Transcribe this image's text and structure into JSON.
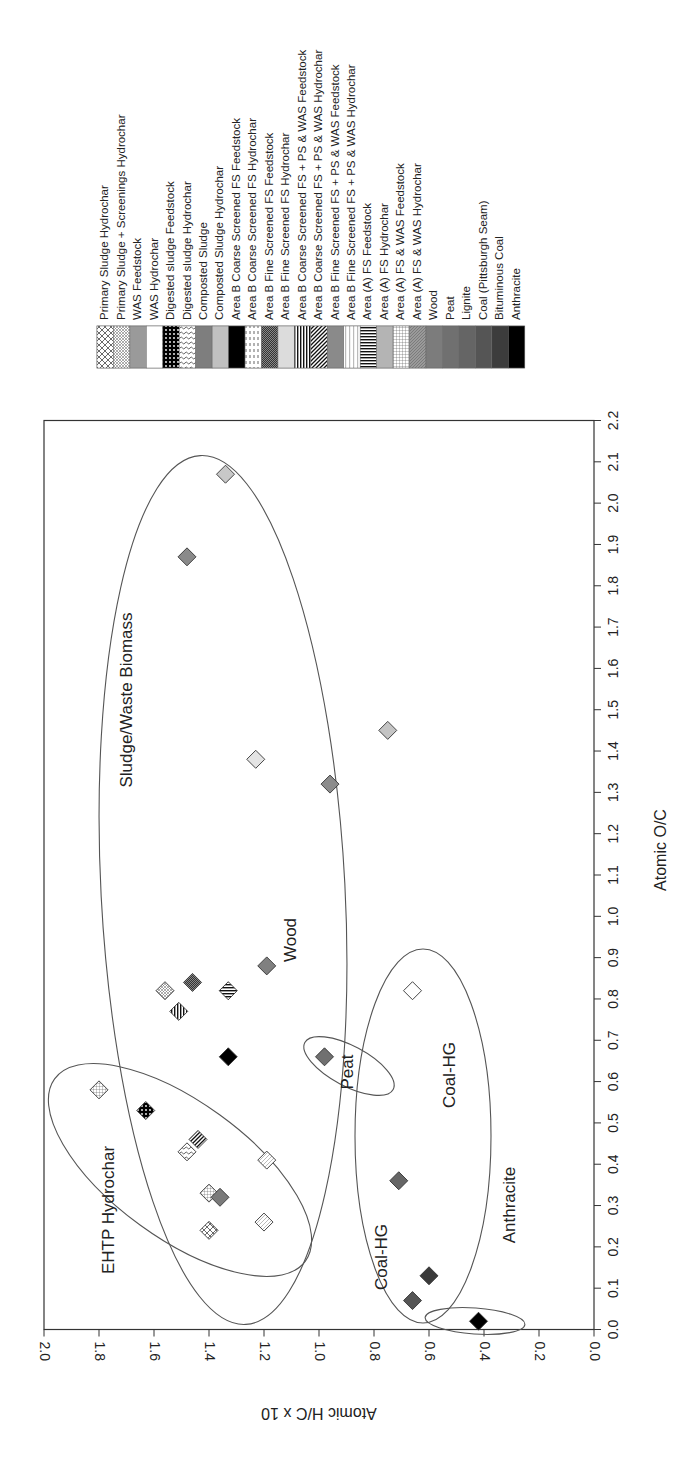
{
  "chart_data": {
    "type": "scatter",
    "title": "",
    "orientation_note": "Figure rotated 90 degrees counter-clockwise on page",
    "xlabel": "Atomic H/C x 10",
    "ylabel": "Atomic O/C",
    "xlim": [
      0.0,
      2.0
    ],
    "ylim": [
      0.0,
      2.2
    ],
    "x_ticks": [
      "0.0",
      "0.2",
      "0.4",
      "0.6",
      "0.8",
      "1.0",
      "1.2",
      "1.4",
      "1.6",
      "1.8",
      "2.0"
    ],
    "y_ticks": [
      "0.0",
      "0.1",
      "0.2",
      "0.3",
      "0.4",
      "0.5",
      "0.6",
      "0.7",
      "0.8",
      "0.9",
      "1.0",
      "1.1",
      "1.2",
      "1.3",
      "1.4",
      "1.5",
      "1.6",
      "1.7",
      "1.8",
      "1.9",
      "2.0",
      "2.1",
      "2.2"
    ],
    "grid": false,
    "legend_position": "top (rotated)",
    "legend": [
      {
        "label": "Primary Sludge Hydrochar",
        "pattern": "crosshatch-large"
      },
      {
        "label": "Primary Sludge + Screenings Hydrochar",
        "pattern": "crosshatch-fine"
      },
      {
        "label": "WAS Feedstock",
        "pattern": "gray"
      },
      {
        "label": "WAS Hydrochar",
        "pattern": "white"
      },
      {
        "label": "Digested sludge Feedstock",
        "pattern": "black-dots"
      },
      {
        "label": "Digested sludge Hydrochar",
        "pattern": "squiggle"
      },
      {
        "label": "Composted Sludge",
        "pattern": "mid-gray"
      },
      {
        "label": "Composted Sludge Hydrochar",
        "pattern": "light-gray"
      },
      {
        "label": "Area B Coarse Screened FS Feedstock",
        "pattern": "black"
      },
      {
        "label": "Area B Coarse Screened FS Hydrochar",
        "pattern": "dashes"
      },
      {
        "label": "Area B Fine Screened FS Feedstock",
        "pattern": "dark-checker"
      },
      {
        "label": "Area B Fine Screened FS Hydrochar",
        "pattern": "very-light-gray"
      },
      {
        "label": "Area B Coarse Screened FS + PS & WAS Feedstock",
        "pattern": "vertical-stripes"
      },
      {
        "label": "Area B Coarse Screened FS + PS & WAS Hydrochar",
        "pattern": "diagonal-stripes"
      },
      {
        "label": "Area B Fine Screened FS + PS & WAS Feedstock",
        "pattern": "gray-2"
      },
      {
        "label": "Area B Fine Screened FS + PS & WAS Hydrochar",
        "pattern": "thin-lines"
      },
      {
        "label": "Area (A) FS Feedstock",
        "pattern": "horizontal-stripes"
      },
      {
        "label": "Area (A) FS Hydrochar",
        "pattern": "light-gray-2"
      },
      {
        "label": "Area (A) FS & WAS Feedstock",
        "pattern": "grid"
      },
      {
        "label": "Area (A) FS & WAS Hydrochar",
        "pattern": "diag-gray"
      },
      {
        "label": "Wood",
        "pattern": "gray-3"
      },
      {
        "label": "Peat",
        "pattern": "gray-4"
      },
      {
        "label": "Lignite",
        "pattern": "gray-5"
      },
      {
        "label": "Coal (Pittsburgh Seam)",
        "pattern": "dark-gray"
      },
      {
        "label": "Bituminous Coal",
        "pattern": "darker-gray"
      },
      {
        "label": "Anthracite",
        "pattern": "black-2"
      }
    ],
    "points": [
      {
        "series": "Composted Sludge Hydrochar",
        "x": 1.34,
        "y": 2.07,
        "fill": "#c8c8c8"
      },
      {
        "series": "Composted Sludge",
        "x": 1.48,
        "y": 1.87,
        "fill": "#8a8a8a"
      },
      {
        "series": "Area (A) FS Hydrochar",
        "x": 0.75,
        "y": 1.45,
        "fill": "#c4c4c4"
      },
      {
        "series": "Area B Fine Screened FS Hydrochar",
        "x": 1.23,
        "y": 1.38,
        "fill": "#e4e4e4"
      },
      {
        "series": "WAS Feedstock",
        "x": 0.96,
        "y": 1.32,
        "fill": "#8c8c8c"
      },
      {
        "series": "Wood",
        "x": 1.19,
        "y": 0.88,
        "fill": "#808080"
      },
      {
        "series": "Area B Fine Screened FS Feedstock",
        "x": 1.46,
        "y": 0.84,
        "fill": "url(#p-checker)"
      },
      {
        "series": "Primary Sludge + Screenings Hydrochar",
        "x": 1.56,
        "y": 0.82,
        "fill": "url(#p-xfine)"
      },
      {
        "series": "Area (A) FS Feedstock",
        "x": 1.33,
        "y": 0.82,
        "fill": "url(#p-hstripe)"
      },
      {
        "series": "WAS Hydrochar",
        "x": 0.66,
        "y": 0.82,
        "fill": "#ffffff"
      },
      {
        "series": "Area B Coarse Screened FS + PS & WAS Feedstock",
        "x": 1.51,
        "y": 0.77,
        "fill": "url(#p-vstripe)"
      },
      {
        "series": "Area B Coarse Screened FS Feedstock",
        "x": 1.33,
        "y": 0.66,
        "fill": "#000000"
      },
      {
        "series": "Peat",
        "x": 0.98,
        "y": 0.66,
        "fill": "#707070"
      },
      {
        "series": "Area (A) FS & WAS Feedstock",
        "x": 1.8,
        "y": 0.58,
        "fill": "url(#p-grid)"
      },
      {
        "series": "Digested sludge Feedstock",
        "x": 1.63,
        "y": 0.53,
        "fill": "url(#p-dots)"
      },
      {
        "series": "Area B Coarse Screened FS + PS & WAS Hydrochar",
        "x": 1.44,
        "y": 0.46,
        "fill": "url(#p-diag)"
      },
      {
        "series": "Digested sludge Hydrochar",
        "x": 1.48,
        "y": 0.43,
        "fill": "url(#p-squig)"
      },
      {
        "series": "Area B Coarse Screened FS Hydrochar",
        "x": 1.19,
        "y": 0.41,
        "fill": "url(#p-diagthin)"
      },
      {
        "series": "Area (A) FS & WAS Hydrochar",
        "x": 1.4,
        "y": 0.33,
        "fill": "url(#p-grid)"
      },
      {
        "series": "Area B Fine Screened FS + PS & WAS Feedstock",
        "x": 1.36,
        "y": 0.32,
        "fill": "#7a7a7a"
      },
      {
        "series": "Lignite",
        "x": 0.71,
        "y": 0.36,
        "fill": "#666666"
      },
      {
        "series": "Primary Sludge Hydrochar",
        "x": 1.4,
        "y": 0.24,
        "fill": "url(#p-xlarge)"
      },
      {
        "series": "Area B Fine Screened FS + PS & WAS Hydrochar",
        "x": 1.2,
        "y": 0.26,
        "fill": "url(#p-diagthin)"
      },
      {
        "series": "Bituminous Coal",
        "x": 0.6,
        "y": 0.13,
        "fill": "#3a3a3a"
      },
      {
        "series": "Coal (Pittsburgh Seam)",
        "x": 0.66,
        "y": 0.07,
        "fill": "#555555"
      },
      {
        "series": "Anthracite",
        "x": 0.42,
        "y": 0.02,
        "fill": "#000000"
      }
    ],
    "annotations": [
      {
        "text": "Sludge/Waste Biomass",
        "x": 1.7,
        "y": 1.55
      },
      {
        "text": "Wood",
        "x": 1.1,
        "y": 0.95
      },
      {
        "text": "EHTP Hydrochar",
        "x": 1.75,
        "y": 0.35
      },
      {
        "text": "Peat",
        "x": 0.89,
        "y": 0.62
      },
      {
        "text": "Coal-HG",
        "x": 0.52,
        "y": 0.62
      },
      {
        "text": "Coal-HG",
        "x": 0.77,
        "y": 0.18
      },
      {
        "text": "Anthracite",
        "x": 0.3,
        "y": 0.3
      }
    ],
    "ellipses": [
      {
        "name": "Sludge/Waste Biomass",
        "cx": 1.34,
        "cy": 1.33,
        "rx_hc": 0.82,
        "ry_oc": 0.79
      },
      {
        "name": "EHTP Hydrochar",
        "cx": 1.5,
        "cy": 0.39
      },
      {
        "name": "Peat",
        "cx": 0.92,
        "cy": 0.64
      },
      {
        "name": "Coal-HG",
        "cx": 0.7,
        "cy": 0.48
      },
      {
        "name": "Anthracite",
        "cx": 0.48,
        "cy": 0.03
      }
    ]
  }
}
